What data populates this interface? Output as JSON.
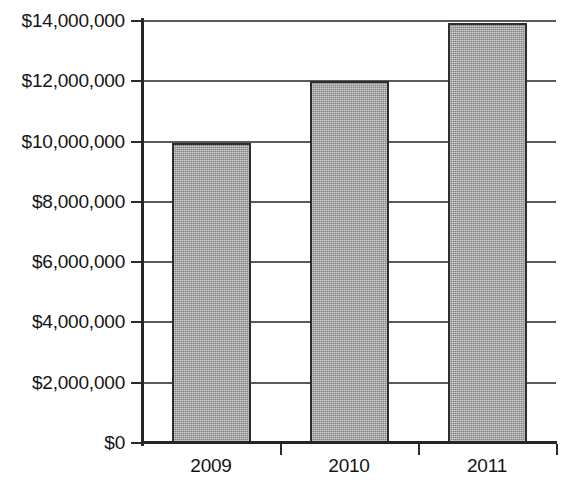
{
  "chart_data": {
    "type": "bar",
    "title": "",
    "subtitle": "",
    "xlabel": "",
    "ylabel": "",
    "categories": [
      "2009",
      "2010",
      "2011"
    ],
    "values": [
      9950000,
      12000000,
      13930000
    ],
    "series": [
      {
        "name": "",
        "values": [
          9950000,
          12000000,
          13930000
        ]
      }
    ],
    "ylim": [
      0,
      14000000
    ],
    "ytick_values": [
      0,
      2000000,
      4000000,
      6000000,
      8000000,
      10000000,
      12000000,
      14000000
    ],
    "ytick_labels": [
      "$0",
      "$2,000,000",
      "$4,000,000",
      "$6,000,000",
      "$8,000,000",
      "$10,000,000",
      "$12,000,000",
      "$14,000,000"
    ],
    "grid": true,
    "grid_axis": "y",
    "legend": false,
    "legend_position": "none",
    "bar_color": "#9a9a9a",
    "bar_border_color": "#2e2e2e",
    "axis_color": "#262626",
    "grid_color": "#5a5a5a",
    "background_color": "#ffffff",
    "annotations": []
  }
}
